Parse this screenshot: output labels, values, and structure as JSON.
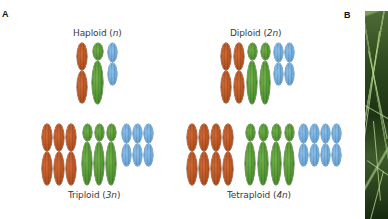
{
  "figure": {
    "panel_a_label": "A",
    "panel_b_label": "B",
    "colors": {
      "chromosome_1": "#b4521f",
      "chromosome_2": "#4f9230",
      "chromosome_3": "#69a6d8"
    },
    "groups": [
      {
        "id": "haploid",
        "label": "Haploid",
        "ploidy": "n",
        "copies": 1
      },
      {
        "id": "diploid",
        "label": "Diploid",
        "ploidy": "2n",
        "copies": 2
      },
      {
        "id": "triploid",
        "label": "Triploid",
        "ploidy": "3n",
        "copies": 3
      },
      {
        "id": "tetraploid",
        "label": "Tetraploid",
        "ploidy": "4n",
        "copies": 4
      }
    ],
    "panel_b": {
      "description": "photo of grass blades",
      "icon": "plant-photo"
    }
  }
}
